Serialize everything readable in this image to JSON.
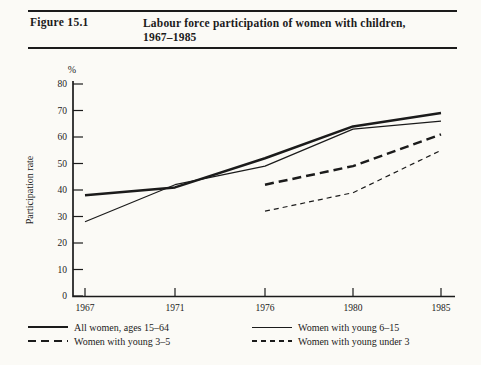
{
  "colors": {
    "ink": "#1b1b1b",
    "paper": "#fbfaf6"
  },
  "header": {
    "figure_label": "Figure 15.1",
    "title_line1": "Labour force participation of women with children,",
    "title_line2": "1967–1985"
  },
  "chart_data": {
    "type": "line",
    "title": "Labour force participation of women with children, 1967–1985",
    "ylabel": "Participation rate",
    "unit_label": "%",
    "ylim": [
      0,
      80
    ],
    "y_ticks": [
      0,
      10,
      20,
      30,
      40,
      50,
      60,
      70,
      80
    ],
    "categories": [
      "1967",
      "1971",
      "1976",
      "1980",
      "1985"
    ],
    "x_spacing": "equal",
    "grid": false,
    "legend_position": "bottom",
    "series": [
      {
        "name": "All women, ages 15–64",
        "style": "thick-solid",
        "values": [
          38,
          41,
          52,
          64,
          69
        ]
      },
      {
        "name": "Women with young 6–15",
        "style": "thin-solid",
        "values": [
          28,
          42,
          49,
          63,
          66
        ]
      },
      {
        "name": "Women with young 3–5",
        "style": "thick-dashed",
        "values": [
          null,
          null,
          42,
          49,
          61
        ]
      },
      {
        "name": "Women with young under 3",
        "style": "thin-dashed",
        "values": [
          null,
          null,
          32,
          39,
          55
        ]
      }
    ]
  }
}
